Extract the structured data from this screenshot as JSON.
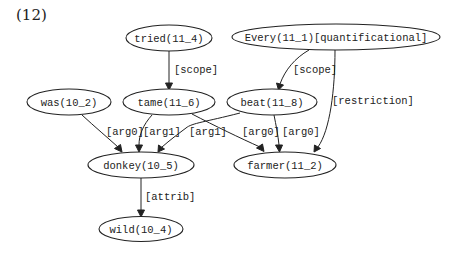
{
  "figure_label": "(12)",
  "nodes": {
    "tried": "tried(11_4)",
    "every": "Every(11_1)[quantificational]",
    "was": "was(10_2)",
    "tame": "tame(11_6)",
    "beat": "beat(11_8)",
    "donkey": "donkey(10_5)",
    "farmer": "farmer(11_2)",
    "wild": "wild(10_4)"
  },
  "edges": {
    "tried_tame": "[scope]",
    "every_beat": "[scope]",
    "every_farmer": "[restriction]",
    "was_donkey": "[arg0]",
    "tame_donkey": "[arg1]",
    "beat_donkey": "[arg1]",
    "tame_farmer": "[arg0]",
    "beat_farmer": "[arg0]",
    "donkey_wild": "[attrib]"
  }
}
